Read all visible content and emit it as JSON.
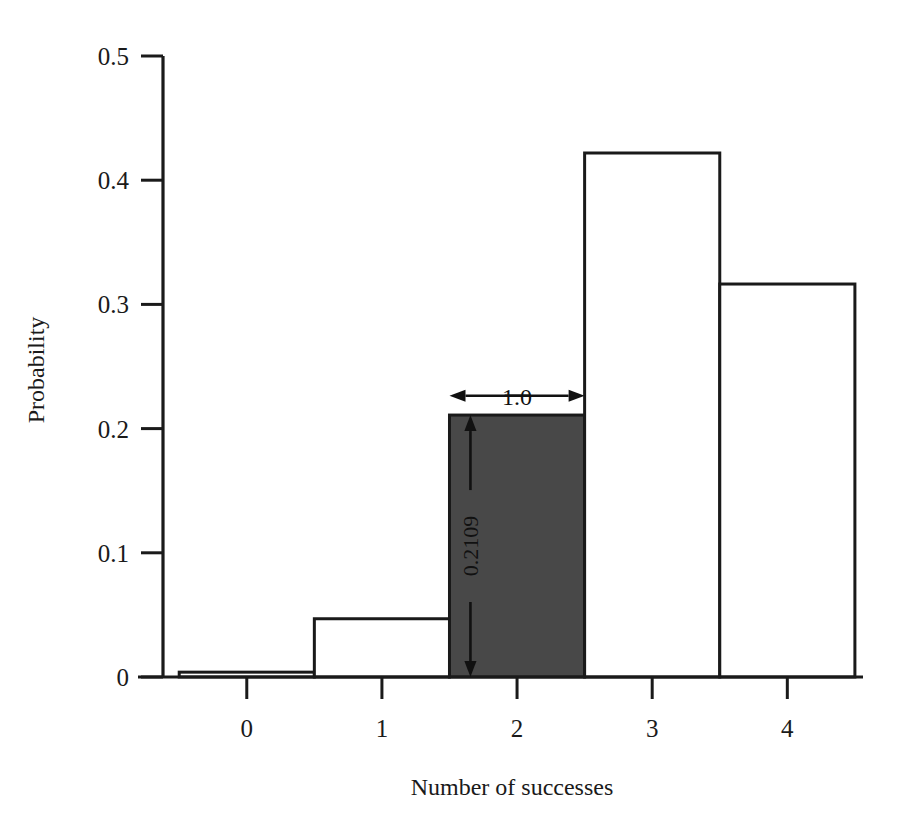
{
  "chart_data": {
    "type": "bar",
    "title": "",
    "subtitle": "",
    "xlabel": "Number of successes",
    "ylabel": "Probability",
    "categories": [
      "0",
      "1",
      "2",
      "3",
      "4"
    ],
    "values": [
      0.0039,
      0.0469,
      0.2109,
      0.4219,
      0.3164
    ],
    "highlight_index": 2,
    "highlight_color": "#484848",
    "bar_edge_color": "#1a1a1a",
    "bar_fill_color": "#ffffff",
    "bar_width": 1.0,
    "xlim": [
      -0.62,
      4.56
    ],
    "ylim": [
      0,
      0.5
    ],
    "ytick_values": [
      0,
      0.1,
      0.2,
      0.3,
      0.4,
      0.5
    ],
    "ytick_labels": [
      "0",
      "0.1",
      "0.2",
      "0.3",
      "0.4",
      "0.5"
    ],
    "xtick_values": [
      0,
      1,
      2,
      3,
      4
    ],
    "xtick_labels": [
      "0",
      "1",
      "2",
      "3",
      "4"
    ],
    "grid": false,
    "legend": null,
    "annotations": [
      {
        "name": "bar-width-annotation",
        "text": "1.0",
        "kind": "double-arrow-horizontal",
        "orientation": "horizontal",
        "from_x": 1.5,
        "to_x": 2.5,
        "at_y": 0.2265
      },
      {
        "name": "bar-height-annotation",
        "text": "0.2109",
        "kind": "double-arrow-vertical",
        "orientation": "vertical-rotated",
        "at_x": 1.655,
        "from_y": 0.2109,
        "to_y": 0
      }
    ]
  },
  "axes": {
    "y_axis_label": "Probability",
    "x_axis_label": "Number of successes"
  }
}
